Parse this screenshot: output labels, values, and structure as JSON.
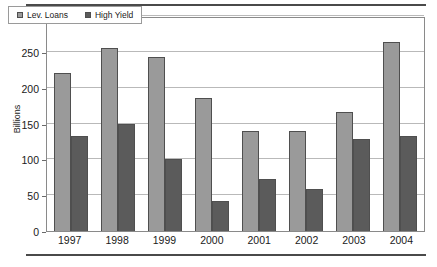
{
  "chart_data": {
    "type": "bar",
    "title": "",
    "xlabel": "",
    "ylabel": "Billions",
    "categories": [
      "1997",
      "1998",
      "1999",
      "2000",
      "2001",
      "2002",
      "2003",
      "2004"
    ],
    "series": [
      {
        "name": "Lev. Loans",
        "color": "#9a9a9a",
        "values": [
          220,
          255,
          243,
          185,
          139,
          139,
          166,
          264
        ]
      },
      {
        "name": "High Yield",
        "color": "#5b5b5b",
        "values": [
          132,
          149,
          100,
          42,
          73,
          58,
          129,
          133
        ]
      }
    ],
    "ylim": [
      0,
      300
    ],
    "yticks": [
      0,
      50,
      100,
      150,
      200,
      250,
      300
    ],
    "ytick_labels": [
      "0",
      "50",
      "100",
      "150",
      "200",
      "250",
      "300"
    ],
    "grid": true,
    "legend_position": "top-left"
  }
}
